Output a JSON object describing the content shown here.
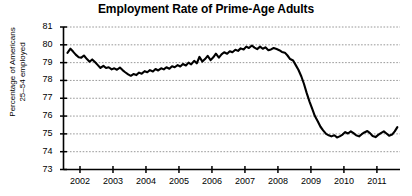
{
  "chart_data": {
    "type": "line",
    "title": "Employment Rate of Prime-Age Adults",
    "xlabel": "",
    "ylabel": "Percentage of Americans 25–54 employed",
    "ylabel_lines": [
      "Percentage of Americans",
      "25–54 employed"
    ],
    "ylim": [
      73,
      81
    ],
    "xlim": [
      2001.5,
      2011.7
    ],
    "yticks": [
      73,
      74,
      75,
      76,
      77,
      78,
      79,
      80,
      81
    ],
    "ytick_labels": [
      "73",
      "74",
      "75",
      "76",
      "77",
      "78",
      "79",
      "80",
      "81"
    ],
    "xticks": [
      2002,
      2003,
      2004,
      2005,
      2006,
      2007,
      2008,
      2009,
      2010,
      2011,
      2012
    ],
    "xtick_labels": [
      "2002",
      "2003",
      "2004",
      "2005",
      "2006",
      "2007",
      "2008",
      "2009",
      "2010",
      "2011",
      ""
    ],
    "grid": true,
    "grid_style": "dotted",
    "grid_color": "#8c8c8c",
    "line_color": "#000000",
    "line_width": 2.1,
    "legend": null,
    "series": [
      {
        "name": "Employment rate, ages 25-54",
        "x": [
          2001.62,
          2001.71,
          2001.79,
          2001.87,
          2001.96,
          2002.04,
          2002.12,
          2002.21,
          2002.29,
          2002.37,
          2002.46,
          2002.54,
          2002.62,
          2002.71,
          2002.79,
          2002.87,
          2002.96,
          2003.04,
          2003.12,
          2003.21,
          2003.29,
          2003.37,
          2003.46,
          2003.54,
          2003.62,
          2003.71,
          2003.79,
          2003.87,
          2003.96,
          2004.04,
          2004.12,
          2004.21,
          2004.29,
          2004.37,
          2004.46,
          2004.54,
          2004.62,
          2004.71,
          2004.79,
          2004.87,
          2004.96,
          2005.04,
          2005.12,
          2005.21,
          2005.29,
          2005.37,
          2005.46,
          2005.54,
          2005.62,
          2005.71,
          2005.79,
          2005.87,
          2005.96,
          2006.04,
          2006.12,
          2006.21,
          2006.29,
          2006.37,
          2006.46,
          2006.54,
          2006.62,
          2006.71,
          2006.79,
          2006.87,
          2006.96,
          2007.04,
          2007.12,
          2007.21,
          2007.29,
          2007.37,
          2007.46,
          2007.54,
          2007.62,
          2007.71,
          2007.79,
          2007.87,
          2007.96,
          2008.04,
          2008.12,
          2008.21,
          2008.29,
          2008.37,
          2008.46,
          2008.54,
          2008.62,
          2008.71,
          2008.79,
          2008.87,
          2008.96,
          2009.04,
          2009.12,
          2009.21,
          2009.29,
          2009.37,
          2009.46,
          2009.54,
          2009.62,
          2009.71,
          2009.79,
          2009.87,
          2009.96,
          2010.04,
          2010.12,
          2010.21,
          2010.29,
          2010.37,
          2010.46,
          2010.54,
          2010.62,
          2010.71,
          2010.79,
          2010.87,
          2010.96,
          2011.04,
          2011.12,
          2011.21,
          2011.29,
          2011.37,
          2011.46,
          2011.54,
          2011.62
        ],
        "values": [
          79.55,
          79.78,
          79.62,
          79.45,
          79.3,
          79.28,
          79.4,
          79.2,
          79.05,
          79.18,
          79.02,
          78.86,
          78.7,
          78.82,
          78.7,
          78.74,
          78.62,
          78.68,
          78.6,
          78.72,
          78.58,
          78.46,
          78.34,
          78.26,
          78.36,
          78.3,
          78.44,
          78.38,
          78.52,
          78.46,
          78.58,
          78.5,
          78.64,
          78.56,
          78.68,
          78.62,
          78.74,
          78.66,
          78.8,
          78.74,
          78.86,
          78.78,
          78.92,
          78.84,
          79.0,
          78.9,
          79.1,
          78.96,
          79.32,
          79.06,
          79.2,
          79.38,
          79.14,
          79.3,
          79.5,
          79.28,
          79.46,
          79.58,
          79.5,
          79.64,
          79.58,
          79.72,
          79.66,
          79.8,
          79.74,
          79.9,
          79.82,
          79.96,
          79.84,
          79.76,
          79.9,
          79.78,
          79.86,
          79.7,
          79.74,
          79.82,
          79.76,
          79.7,
          79.6,
          79.56,
          79.4,
          79.2,
          79.12,
          78.86,
          78.6,
          78.22,
          77.8,
          77.3,
          76.8,
          76.4,
          76.0,
          75.7,
          75.4,
          75.2,
          75.0,
          74.92,
          74.86,
          74.92,
          74.8,
          74.86,
          74.96,
          75.1,
          75.02,
          75.14,
          75.04,
          74.92,
          74.86,
          74.98,
          75.08,
          75.16,
          75.04,
          74.88,
          74.82,
          74.94,
          75.04,
          75.14,
          75.02,
          74.9,
          74.96,
          75.14,
          75.38
        ]
      }
    ]
  }
}
